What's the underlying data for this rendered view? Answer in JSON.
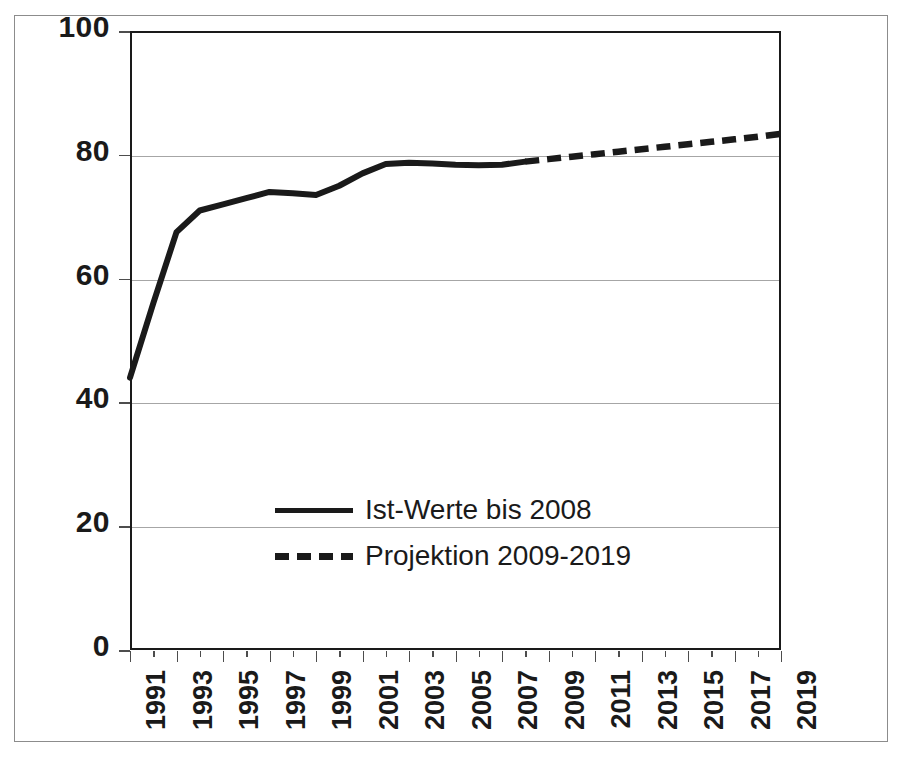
{
  "chart_data": {
    "type": "line",
    "title": "",
    "subtitle": "",
    "xlabel": "",
    "ylabel": "",
    "xlim": [
      1991,
      2019
    ],
    "ylim": [
      0,
      100
    ],
    "grid": true,
    "legend_position": "center-left-inside",
    "y_ticks": [
      0,
      20,
      40,
      60,
      80,
      100
    ],
    "y_tick_labels": [
      "0",
      "20",
      "40",
      "60",
      "80",
      "100"
    ],
    "x_ticks": [
      1991,
      1992,
      1993,
      1994,
      1995,
      1996,
      1997,
      1998,
      1999,
      2000,
      2001,
      2002,
      2003,
      2004,
      2005,
      2006,
      2007,
      2008,
      2009,
      2010,
      2011,
      2012,
      2013,
      2014,
      2015,
      2016,
      2017,
      2018,
      2019
    ],
    "x_tick_labels": [
      "1991",
      "",
      "1993",
      "",
      "1995",
      "",
      "1997",
      "",
      "1999",
      "",
      "2001",
      "",
      "2003",
      "",
      "2005",
      "",
      "2007",
      "",
      "2009",
      "",
      "2011",
      "",
      "2013",
      "",
      "2015",
      "",
      "2017",
      "",
      "2019"
    ],
    "series": [
      {
        "name": "Ist-Werte bis 2008",
        "style": "solid",
        "color": "#1a1a1a",
        "x": [
          1991,
          1992,
          1993,
          1994,
          1995,
          1996,
          1997,
          1998,
          1999,
          2000,
          2001,
          2002,
          2003,
          2004,
          2005,
          2006,
          2007,
          2008
        ],
        "values": [
          44.0,
          56.0,
          67.5,
          71.0,
          72.0,
          73.0,
          74.0,
          73.8,
          73.5,
          75.0,
          77.0,
          78.5,
          78.7,
          78.6,
          78.4,
          78.3,
          78.4,
          78.9
        ]
      },
      {
        "name": "Projektion 2009-2019",
        "style": "dashed",
        "color": "#1a1a1a",
        "x": [
          2008,
          2009,
          2010,
          2011,
          2012,
          2013,
          2014,
          2015,
          2016,
          2017,
          2018,
          2019
        ],
        "values": [
          78.9,
          79.3,
          79.7,
          80.1,
          80.5,
          80.9,
          81.3,
          81.7,
          82.1,
          82.5,
          82.9,
          83.4
        ]
      }
    ]
  },
  "legend": {
    "items": [
      {
        "label": "Ist-Werte bis 2008",
        "style": "solid"
      },
      {
        "label": "Projektion 2009-2019",
        "style": "dashed"
      }
    ]
  },
  "colors": {
    "line": "#1a1a1a",
    "gridline": "#a6a6a6",
    "axis": "#1a1a1a",
    "outer_border": "#8c8c8c",
    "background": "#ffffff",
    "text": "#1a1a1a"
  }
}
